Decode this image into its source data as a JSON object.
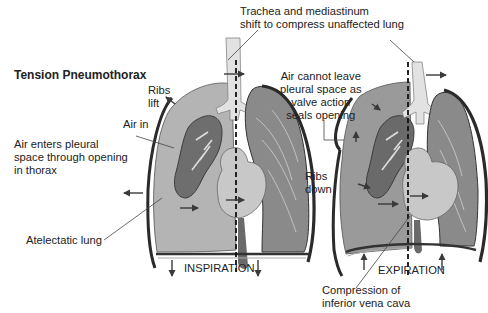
{
  "title": "Tension Pneumothorax",
  "labels": {
    "trachea_shift": [
      "Trachea and mediastinum",
      "shift to compress unaffected lung"
    ],
    "ribs_lift": [
      "Ribs",
      "lift"
    ],
    "air_in": "Air in",
    "air_enters": [
      "Air enters pleural",
      "space through opening",
      "in thorax"
    ],
    "atelectatic": "Atelectatic lung",
    "inspiration": "INSPIRATION",
    "air_cannot_leave": [
      "Air cannot leave",
      "pleural space as",
      "valve action",
      "seals opening"
    ],
    "ribs_down": [
      "Ribs",
      "down"
    ],
    "expiration": "EXPIRATION",
    "ivc_compression": [
      "Compression of",
      "inferior vena cava"
    ]
  },
  "panels": [
    {
      "name": "inspiration",
      "phase_label": "INSPIRATION"
    },
    {
      "name": "expiration",
      "phase_label": "EXPIRATION"
    }
  ],
  "colors": {
    "pleural_air": "#b4b4b4",
    "collapsed_lung": "#6e6e6e",
    "healthy_lung": "#8a8a8a",
    "heart": "#c8c8c8",
    "trachea": "#e2e2e2",
    "rib_wall": "#2a2a2a",
    "arrow": "#3a3a3a"
  }
}
